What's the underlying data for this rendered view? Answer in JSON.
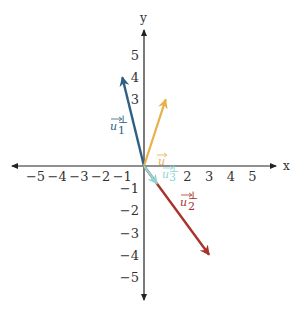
{
  "diagram": {
    "axes": {
      "x_label": "x",
      "y_label": "y",
      "x_ticks": [
        "−5",
        "−4",
        "−3",
        "−2",
        "−1",
        "2",
        "3",
        "4",
        "5"
      ],
      "x_tick_values": [
        -5,
        -4,
        -3,
        -2,
        -1,
        2,
        3,
        4,
        5
      ],
      "y_ticks": [
        "5",
        "4",
        "3",
        "−1",
        "−2",
        "−3",
        "−4",
        "−5"
      ],
      "y_tick_values": [
        5,
        4,
        3,
        -1,
        -2,
        -3,
        -4,
        -5
      ],
      "range": [
        -6,
        6
      ]
    },
    "vectors": [
      {
        "name": "u",
        "label": "u",
        "sup": "",
        "sub": "",
        "x": 1,
        "y": 3,
        "color": "#e8b04a"
      },
      {
        "name": "u1-perp",
        "label": "u",
        "sup": "⊥",
        "sub": "1",
        "x": -1,
        "y": 4,
        "color": "#2f5f82"
      },
      {
        "name": "u2-perp",
        "label": "u",
        "sup": "⊥",
        "sub": "2",
        "x": 3,
        "y": -4,
        "color": "#a8322c"
      },
      {
        "name": "u3-perp",
        "label": "u",
        "sup": "⊥",
        "sub": "3",
        "x": 0.6,
        "y": -0.8,
        "color": "#8fd3d3"
      }
    ]
  }
}
